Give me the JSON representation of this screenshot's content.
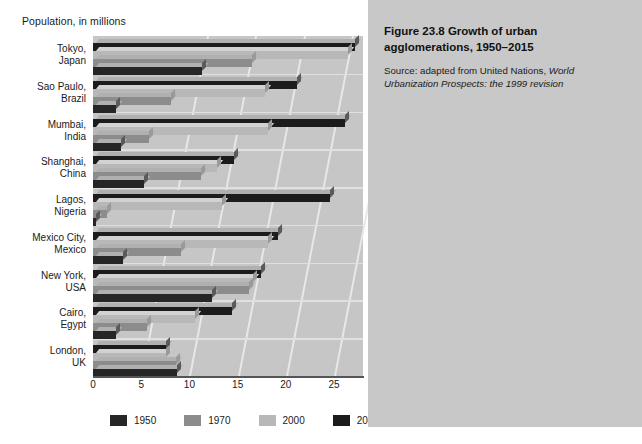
{
  "axis_title": "Population, in millions",
  "caption": {
    "title": "Figure 23.8  Growth of urban agglomerations, 1950–2015",
    "source_prefix": "Source: adapted from United Nations, ",
    "source_italic_1": "World Urbanization Prospects:",
    "source_italic_2": " the 1999 revision"
  },
  "legend": {
    "items": [
      {
        "label": "1950",
        "color": "#262626"
      },
      {
        "label": "1970",
        "color": "#8c8c8c"
      },
      {
        "label": "2000",
        "color": "#b8b8b8"
      },
      {
        "label": "2015",
        "color": "#1c1c1c"
      }
    ]
  },
  "colors": {
    "panel_bg": "#c8c8c8",
    "plot_floor": "#c6c6c6",
    "gridline": "#e8e8e8",
    "axis_line": "#555555",
    "bar_1950": "#262626",
    "bar_1970": "#8c8c8c",
    "bar_2000": "#b8b8b8",
    "bar_2015": "#1c1c1c"
  },
  "chart_data": {
    "type": "bar",
    "orientation": "horizontal",
    "title": "Figure 23.8  Growth of urban agglomerations, 1950–2015",
    "xlabel": "Population, in millions",
    "ylabel": "",
    "xlim": [
      0,
      28
    ],
    "xticks": [
      0,
      5,
      10,
      15,
      20,
      25
    ],
    "grid": true,
    "legend_position": "bottom",
    "categories": [
      "Tokyo, Japan",
      "Sao Paulo, Brazil",
      "Mumbai, India",
      "Shanghai, China",
      "Lagos, Nigeria",
      "Mexico City, Mexico",
      "New York, USA",
      "Cairo, Egypt",
      "London, UK"
    ],
    "city_lines": [
      [
        "Tokyo,",
        "Japan"
      ],
      [
        "Sao Paulo,",
        "Brazil"
      ],
      [
        "Mumbai,",
        "India"
      ],
      [
        "Shanghai,",
        "China"
      ],
      [
        "Lagos,",
        "Nigeria"
      ],
      [
        "Mexico City,",
        "Mexico"
      ],
      [
        "New York,",
        "USA"
      ],
      [
        "Cairo,",
        "Egypt"
      ],
      [
        "London,",
        "UK"
      ]
    ],
    "series": [
      {
        "name": "1950",
        "color": "#262626",
        "values": [
          11.3,
          2.4,
          2.9,
          5.3,
          0.3,
          3.1,
          12.3,
          2.4,
          8.7
        ]
      },
      {
        "name": "1970",
        "color": "#8c8c8c",
        "values": [
          16.5,
          8.1,
          5.8,
          11.2,
          1.4,
          9.1,
          16.2,
          5.6,
          8.6
        ]
      },
      {
        "name": "2000",
        "color": "#b8b8b8",
        "values": [
          26.4,
          17.8,
          18.1,
          12.9,
          13.4,
          18.1,
          16.6,
          10.6,
          7.6
        ]
      },
      {
        "name": "2015",
        "color": "#1c1c1c",
        "values": [
          27.2,
          21.2,
          26.1,
          14.6,
          24.6,
          19.2,
          17.4,
          14.4,
          7.6
        ]
      }
    ]
  }
}
